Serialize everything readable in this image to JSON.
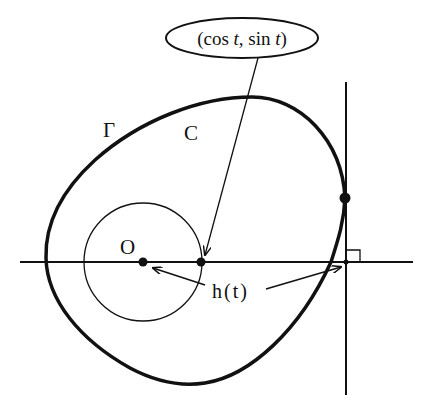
{
  "figure": {
    "labels": {
      "point_label": "(cos t, sin t)",
      "curve_gamma": "Γ",
      "curve_c": "C",
      "origin": "O",
      "support_function": "h(t)"
    },
    "point_label_parts": {
      "open": "(cos ",
      "t1": "t",
      "mid": ", sin ",
      "t2": "t",
      "close": ")"
    },
    "colors": {
      "stroke": "#111111",
      "background": "#ffffff"
    }
  }
}
